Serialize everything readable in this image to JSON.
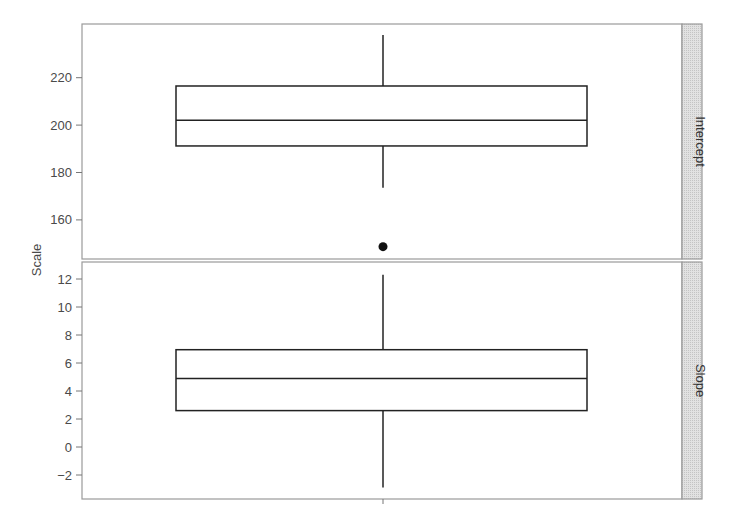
{
  "chart_data": {
    "type": "boxplot",
    "title": "",
    "xlabel": "",
    "ylabel": "Scale",
    "layout": "faceted vertical panels with right-side strip labels",
    "grid": false,
    "legend": null,
    "panels": [
      {
        "strip_label": "Intercept",
        "ylim": [
          144,
          240
        ],
        "yticks": [
          160,
          180,
          200,
          220
        ],
        "ytick_labels": [
          "160",
          "180",
          "200",
          "220"
        ],
        "box": {
          "whisker_low": 173.6,
          "q1": 191.2,
          "median": 202,
          "q3": 216.5,
          "whisker_high": 238
        },
        "outliers": [
          148.7
        ]
      },
      {
        "strip_label": "Slope",
        "ylim": [
          -3.8,
          12.6
        ],
        "yticks": [
          -2,
          0,
          2,
          4,
          6,
          8,
          10,
          12
        ],
        "ytick_labels": [
          "−2",
          "0",
          "2",
          "4",
          "6",
          "8",
          "10",
          "12"
        ],
        "box": {
          "whisker_low": -2.9,
          "q1": 2.6,
          "median": 4.9,
          "q3": 6.95,
          "whisker_high": 12.3
        },
        "outliers": []
      }
    ]
  },
  "style": {
    "panel_border": "#9a9a9a",
    "box_stroke": "#222222",
    "strip_fill": "#d9d9d9",
    "strip_border": "#9a9a9a",
    "tick_color": "#777777",
    "outlier_fill": "#111111"
  },
  "geometry": {
    "panel_left": 82,
    "panel_right": 682,
    "strip_right": 702,
    "box_left": 176,
    "box_right": 587,
    "center_x": 383,
    "panels": [
      {
        "top": 24,
        "bottom": 259,
        "y_ref_value": 220,
        "y_ref_px": 77.7,
        "px_per_unit": 2.37
      },
      {
        "top": 262,
        "bottom": 499,
        "y_ref_value": 0,
        "y_ref_px": 447,
        "px_per_unit": 14.0
      }
    ],
    "ylabel_x": 41,
    "ylabel_y": 260
  }
}
